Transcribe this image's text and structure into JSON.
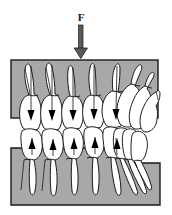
{
  "figure": {
    "name": "occlusal-load-diagram",
    "caption": "",
    "background_color": "#ffffff"
  },
  "force": {
    "label": "F",
    "direction": "down",
    "arrow_name": "force-arrow",
    "color": "#4a4a4a",
    "outline_color": "#1a1a1a",
    "x": 81,
    "tail_y": 24,
    "head_y": 57
  },
  "blocks": {
    "fill": "#a8a8a8",
    "stroke": "#1a1a1a",
    "upper": {
      "name": "upper-loading-block",
      "x": 11,
      "y": 60,
      "width": 147,
      "height": 58
    },
    "lower": {
      "name": "lower-support-block",
      "points": "11,148 132,148 132,163 160,163 160,205 11,205",
      "x": 11,
      "y": 148,
      "width": 149,
      "height": 57,
      "step_x": 132,
      "step_y": 163
    }
  },
  "dentition": {
    "tooth_fill": "#ffffff",
    "tooth_stroke": "#1a1a1a",
    "contact_arrow_color": "#000000",
    "upper_row_name": "upper-teeth-row",
    "lower_row_name": "lower-teeth-row",
    "upper_teeth": [
      {
        "name": "upper-molar-1",
        "type": "molar"
      },
      {
        "name": "upper-molar-2",
        "type": "molar"
      },
      {
        "name": "upper-premolar-1",
        "type": "premolar"
      },
      {
        "name": "upper-premolar-2",
        "type": "premolar"
      },
      {
        "name": "upper-canine",
        "type": "canine"
      },
      {
        "name": "upper-incisor-1",
        "type": "incisor"
      },
      {
        "name": "upper-incisor-2",
        "type": "incisor"
      },
      {
        "name": "upper-incisor-3",
        "type": "incisor"
      }
    ],
    "lower_teeth": [
      {
        "name": "lower-molar-1",
        "type": "molar"
      },
      {
        "name": "lower-molar-2",
        "type": "molar"
      },
      {
        "name": "lower-premolar-1",
        "type": "premolar"
      },
      {
        "name": "lower-premolar-2",
        "type": "premolar"
      },
      {
        "name": "lower-canine",
        "type": "canine"
      },
      {
        "name": "lower-incisor-1",
        "type": "incisor"
      },
      {
        "name": "lower-incisor-2",
        "type": "incisor"
      },
      {
        "name": "lower-incisor-3",
        "type": "incisor"
      }
    ],
    "contact_arrows_down": 5,
    "contact_arrows_up": 5
  }
}
